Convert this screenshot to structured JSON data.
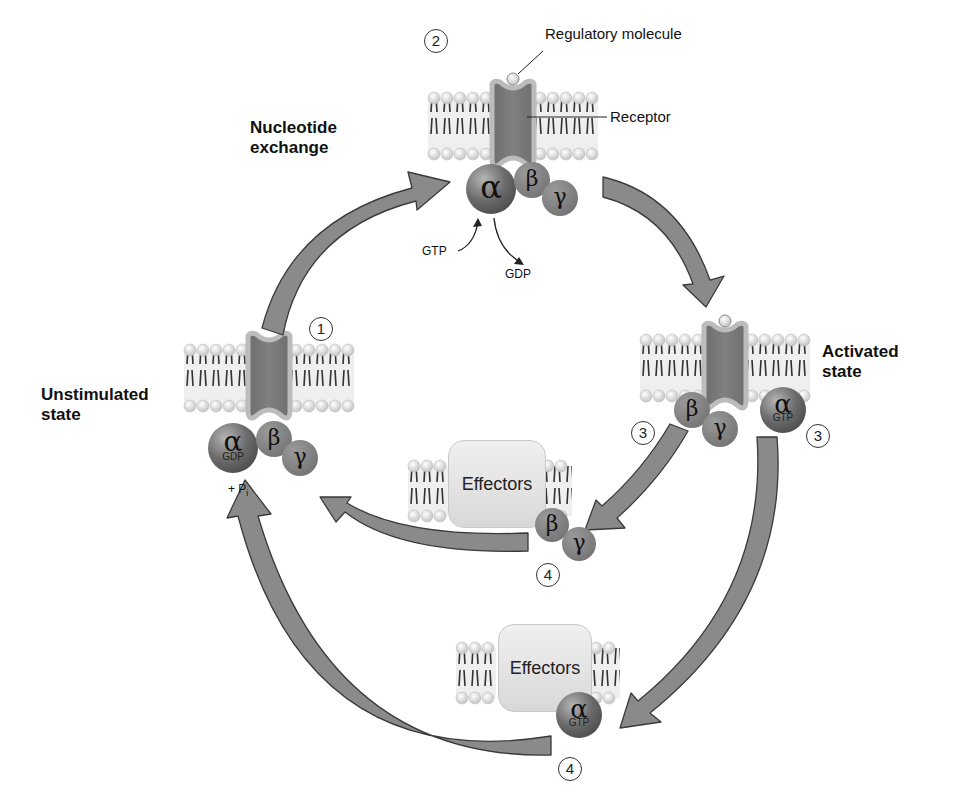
{
  "diagram": {
    "states": {
      "unstimulated": "Unstimulated\nstate",
      "unstimulated_line1": "Unstimulated",
      "unstimulated_line2": "state",
      "nucleotide_exchange_line1": "Nucleotide",
      "nucleotide_exchange_line2": "exchange",
      "activated_line1": "Activated",
      "activated_line2": "state"
    },
    "labels": {
      "regulatory_molecule": "Regulatory molecule",
      "receptor": "Receptor",
      "gtp_in": "GTP",
      "gdp_out": "GDP",
      "pi": "+ P",
      "pi_sub": "i",
      "effectors_1": "Effectors",
      "effectors_2": "Effectors"
    },
    "subunits": {
      "alpha": "α",
      "beta": "β",
      "gamma": "γ",
      "gdp": "GDP",
      "gtp": "GTP"
    },
    "steps": {
      "s1": "1",
      "s2": "2",
      "s3a": "3",
      "s3b": "3",
      "s4a": "4",
      "s4b": "4"
    },
    "colors": {
      "arrow_fill": "#8a8a8a",
      "arrow_stroke": "#3a3a3a",
      "membrane_head": "#e8e8e8",
      "membrane_bg": "#ececec",
      "receptor": "#7a7a7a",
      "alpha": "#5a5a5a",
      "beta_gamma": "#808080"
    }
  }
}
